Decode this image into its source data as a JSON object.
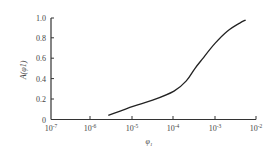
{
  "chart_data": {
    "type": "line",
    "title": "",
    "xlabel": "φ1",
    "ylabel": "A(φ1)",
    "xscale": "log",
    "xlim": [
      1e-07,
      0.01
    ],
    "ylim": [
      0,
      1.0
    ],
    "x_ticks": [
      "10^-7",
      "10^-6",
      "10^-5",
      "10^-4",
      "10^-3",
      "10^-2"
    ],
    "y_ticks": [
      "0",
      "0.2",
      "0.4",
      "0.6",
      "0.8",
      "1.0"
    ],
    "grid": false,
    "legend": null,
    "series": [
      {
        "name": "A(φ1)",
        "x": [
          2.5e-06,
          1e-05,
          3e-05,
          0.0001,
          0.0002,
          0.00032,
          0.0005,
          0.001,
          0.002,
          0.004,
          0.0056
        ],
        "y": [
          0.04,
          0.13,
          0.19,
          0.28,
          0.38,
          0.5,
          0.6,
          0.75,
          0.87,
          0.95,
          0.98
        ]
      }
    ]
  },
  "labels": {
    "x_ticks": [
      {
        "base": "10",
        "exp": "-7"
      },
      {
        "base": "10",
        "exp": "-6"
      },
      {
        "base": "10",
        "exp": "-5"
      },
      {
        "base": "10",
        "exp": "-4"
      },
      {
        "base": "10",
        "exp": "-3"
      },
      {
        "base": "10",
        "exp": "-2"
      }
    ],
    "y_ticks": [
      "0",
      "0.2",
      "0.4",
      "0.6",
      "0.8",
      "1.0"
    ],
    "xlabel_main": "φ",
    "xlabel_sub": "1",
    "ylabel_text": "A(φ1)"
  }
}
